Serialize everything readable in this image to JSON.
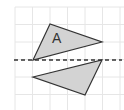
{
  "diagram": {
    "grid": {
      "x_lines": [
        15,
        32.5,
        50,
        67.5,
        85,
        102.5,
        120
      ],
      "y_lines": [
        7,
        24.5,
        42,
        59.5,
        77,
        94.5
      ],
      "color": "#e6e6e6"
    },
    "mirror_line": {
      "x1": 14,
      "y1": 60,
      "x2": 122,
      "y2": 60,
      "color": "#333333",
      "style": "dashed"
    },
    "shapes": [
      {
        "name": "triangle-a",
        "label": "A",
        "points": "50,24 33,60 102,42",
        "fill": "#d3d3d3",
        "stroke": "#333333",
        "label_x": 52,
        "label_y": 43
      },
      {
        "name": "triangle-reflection",
        "label": "",
        "points": "33,77 102,60 85,95",
        "fill": "#d3d3d3",
        "stroke": "#333333"
      }
    ]
  }
}
